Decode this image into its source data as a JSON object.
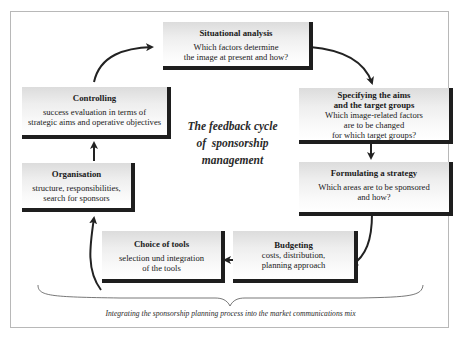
{
  "diagram": {
    "center_title": [
      "The feedback cycle",
      "of  sponsorship",
      "management"
    ],
    "caption": "Integrating the sponsorship planning process into the market communications mix",
    "steps": [
      {
        "id": "situational-analysis",
        "title": "Situational analysis",
        "lines": [
          "Which factors determine",
          "the image at present and how?"
        ]
      },
      {
        "id": "specifying-aims",
        "title": [
          "Specifying the aims",
          "and the target groups"
        ],
        "lines": [
          "Which image-related factors",
          "are to be changed",
          "for which target groups?"
        ]
      },
      {
        "id": "formulating-strategy",
        "title": "Formulating a strategy",
        "lines": [
          "Which areas are to be sponsored",
          "and how?"
        ]
      },
      {
        "id": "budgeting",
        "title": "Budgeting",
        "lines": [
          "costs, distribution,",
          "planning approach"
        ]
      },
      {
        "id": "choice-of-tools",
        "title": "Choice of tools",
        "lines": [
          "selection und integration",
          "of the tools"
        ]
      },
      {
        "id": "organisation",
        "title": "Organisation",
        "lines": [
          "structure, responsibilities,",
          "search for sponsors"
        ]
      },
      {
        "id": "controlling",
        "title": "Controlling",
        "lines": [
          "success evaluation in terms of",
          "strategic aims and operative objectives"
        ]
      }
    ],
    "flow": [
      "situational-analysis",
      "specifying-aims",
      "formulating-strategy",
      "budgeting",
      "choice-of-tools",
      "organisation",
      "controlling",
      "situational-analysis"
    ],
    "colors": {
      "shadow": "#1e1e1e",
      "box_top": "#dcdcdc",
      "box_bottom": "#ffffff",
      "frame": "#b8b8b8",
      "arrow": "#222222"
    }
  }
}
